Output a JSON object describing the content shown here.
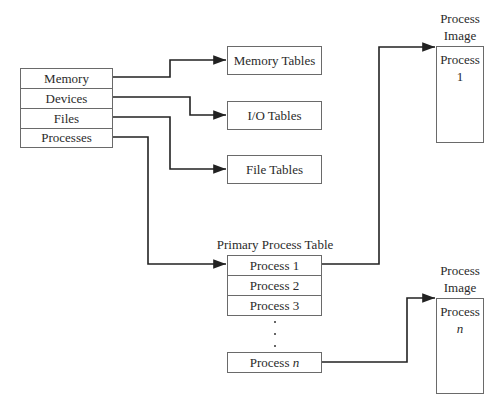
{
  "diagram": {
    "type": "process-control-structures",
    "os_table": {
      "rows": [
        "Memory",
        "Devices",
        "Files",
        "Processes"
      ]
    },
    "tables": [
      {
        "label": "Memory Tables"
      },
      {
        "label": "I/O Tables"
      },
      {
        "label": "File Tables"
      }
    ],
    "primary_process_table": {
      "title": "Primary Process Table",
      "rows": [
        "Process 1",
        "Process 2",
        "Process 3"
      ],
      "last_row_prefix": "Process",
      "last_row_var": "n"
    },
    "process_images": [
      {
        "title_line1": "Process",
        "title_line2": "Image",
        "content_line1": "Process",
        "content_line2": "1"
      },
      {
        "title_line1": "Process",
        "title_line2": "Image",
        "content_line1": "Process",
        "content_line2": "n"
      }
    ],
    "edges": [
      {
        "from": "Memory",
        "to": "Memory Tables"
      },
      {
        "from": "Devices",
        "to": "I/O Tables"
      },
      {
        "from": "Files",
        "to": "File Tables"
      },
      {
        "from": "Processes",
        "to": "Primary Process Table"
      },
      {
        "from": "Process 1",
        "to": "Process Image 1"
      },
      {
        "from": "Process n",
        "to": "Process Image n"
      }
    ]
  }
}
